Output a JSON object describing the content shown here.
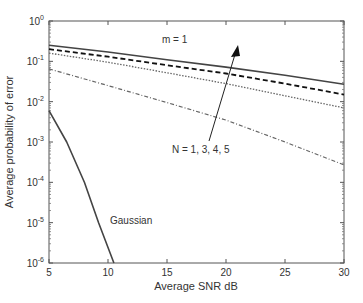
{
  "chart_data": {
    "type": "line",
    "title": "",
    "xlabel": "Average SNR dB",
    "ylabel": "Average probability of error",
    "xlim": [
      5,
      30
    ],
    "ylim": [
      1e-06,
      1
    ],
    "yscale": "log",
    "grid": false,
    "x_ticks": [
      5,
      10,
      15,
      20,
      25,
      30
    ],
    "x_tick_labels": [
      "5",
      "10",
      "15",
      "20",
      "25",
      "30"
    ],
    "y_ticks": [
      1,
      0.1,
      0.01,
      0.001,
      0.0001,
      1e-05,
      1e-06
    ],
    "y_tick_labels": [
      {
        "base": "10",
        "exp": "0"
      },
      {
        "base": "10",
        "exp": "-1"
      },
      {
        "base": "10",
        "exp": "-2"
      },
      {
        "base": "10",
        "exp": "-3"
      },
      {
        "base": "10",
        "exp": "-4"
      },
      {
        "base": "10",
        "exp": "-5"
      },
      {
        "base": "10",
        "exp": "-6"
      }
    ],
    "series": [
      {
        "name": "N = 1",
        "style": "solid",
        "x": [
          5,
          10,
          15,
          20,
          25,
          30
        ],
        "values": [
          0.25,
          0.17,
          0.11,
          0.072,
          0.045,
          0.027
        ]
      },
      {
        "name": "N = 3",
        "style": "dashed",
        "x": [
          5,
          10,
          15,
          20,
          25,
          30
        ],
        "values": [
          0.2,
          0.13,
          0.08,
          0.05,
          0.028,
          0.015
        ]
      },
      {
        "name": "N = 4",
        "style": "dotted",
        "x": [
          5,
          10,
          15,
          20,
          25,
          30
        ],
        "values": [
          0.16,
          0.095,
          0.052,
          0.028,
          0.014,
          0.007
        ]
      },
      {
        "name": "N = 5",
        "style": "dashdot",
        "x": [
          5,
          10,
          15,
          20,
          25,
          30
        ],
        "values": [
          0.065,
          0.025,
          0.0095,
          0.0035,
          0.001,
          0.00027
        ]
      },
      {
        "name": "Gaussian",
        "style": "solid",
        "x": [
          5,
          6.5,
          8,
          9.2,
          10.5
        ],
        "values": [
          0.006,
          0.001,
          0.0001,
          1e-05,
          1e-06
        ]
      }
    ],
    "annotations": [
      {
        "text": "m = 1",
        "x": 15.5,
        "y": 0.42
      },
      {
        "text": "N = 1, 3, 4, 5",
        "x": 15.2,
        "y": 0.0028,
        "arrow_to": {
          "x": 21.2,
          "y": 0.4
        }
      },
      {
        "text": "Gaussian",
        "x": 11.2,
        "y": 1.3e-05
      }
    ]
  },
  "axes": {
    "xlabel": "Average SNR dB",
    "ylabel": "Average probability of error"
  },
  "annotations": {
    "m_label": "m = 1",
    "n_label": "N = 1, 3, 4, 5",
    "gaussian_label": "Gaussian"
  }
}
